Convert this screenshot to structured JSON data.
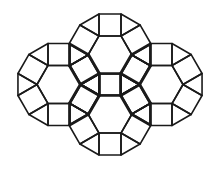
{
  "diagram": {
    "type": "tiling",
    "stroke_color": "#1a1a1a",
    "background_color": "#ffffff",
    "rosettes": [
      {
        "name": "top",
        "tiles": {
          "hexagons": 1,
          "squares": 6,
          "triangles": 6
        }
      },
      {
        "name": "left",
        "tiles": {
          "hexagons": 1,
          "squares": 6,
          "triangles": 6
        }
      },
      {
        "name": "right",
        "tiles": {
          "hexagons": 1,
          "squares": 6,
          "triangles": 6
        }
      },
      {
        "name": "bottom",
        "tiles": {
          "hexagons": 1,
          "squares": 6,
          "triangles": 6
        }
      }
    ]
  }
}
